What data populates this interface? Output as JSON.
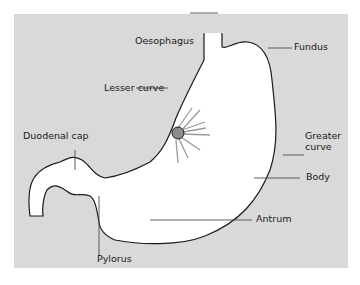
{
  "colors": {
    "background": "#d9d9d9",
    "organ": "#ffffff",
    "outline": "#1a1a1a",
    "ulcer": "#8c8c8c",
    "leader": "#4d4d4d"
  },
  "labels": {
    "oesophagus": "Oesophagus",
    "fundus": "Fundus",
    "lesser_curve": "Lesser curve",
    "greater_curve_1": "Greater",
    "greater_curve_2": "curve",
    "duodenal_cap": "Duodenal cap",
    "body": "Body",
    "antrum": "Antrum",
    "pylorus": "Pylorus"
  }
}
